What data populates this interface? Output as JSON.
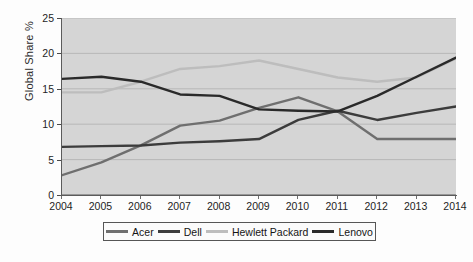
{
  "chart_data": {
    "type": "line",
    "title": "",
    "subtitle": "",
    "xlabel": "",
    "ylabel": "Global Share %",
    "categories": [
      "2004",
      "2005",
      "2006",
      "2007",
      "2008",
      "2009",
      "2010",
      "2011",
      "2012",
      "2013",
      "2014"
    ],
    "x": [
      2004,
      2005,
      2006,
      2007,
      2008,
      2009,
      2010,
      2011,
      2012,
      2013,
      2014
    ],
    "xlim": [
      2004,
      2014
    ],
    "ylim": [
      0,
      25
    ],
    "yticks": [
      0,
      5,
      10,
      15,
      20,
      25
    ],
    "grid": "horizontal",
    "legend_position": "bottom",
    "series": [
      {
        "name": "Acer",
        "color": "#6f6f6f",
        "values": [
          2.8,
          4.6,
          7.0,
          9.8,
          10.5,
          12.3,
          13.8,
          11.8,
          7.9,
          7.9,
          7.9
        ]
      },
      {
        "name": "Dell",
        "color": "#3c3c3c",
        "values": [
          6.8,
          6.9,
          7.0,
          7.4,
          7.6,
          7.9,
          10.6,
          11.9,
          10.6,
          11.6,
          12.5
        ]
      },
      {
        "name": "Hewlett Packard",
        "color": "#bdbdbd",
        "values": [
          14.5,
          14.5,
          16.0,
          17.8,
          18.2,
          19.0,
          17.8,
          16.6,
          16.0,
          16.6,
          19.3
        ]
      },
      {
        "name": "Lenovo",
        "color": "#2a2a2a",
        "values": [
          16.4,
          16.7,
          16.0,
          14.2,
          14.0,
          12.1,
          11.9,
          11.8,
          14.0,
          16.7,
          19.4
        ]
      }
    ]
  },
  "legend": {
    "entries": [
      {
        "label": "Acer"
      },
      {
        "label": "Dell"
      },
      {
        "label": "Hewlett Packard"
      },
      {
        "label": "Lenovo"
      }
    ]
  },
  "axes": {
    "y_tick_labels": [
      "25",
      "20",
      "15",
      "10",
      "5",
      "0"
    ],
    "x_tick_labels": [
      "2004",
      "2005",
      "2006",
      "2007",
      "2008",
      "2009",
      "2010",
      "2011",
      "2012",
      "2013",
      "2014"
    ]
  }
}
